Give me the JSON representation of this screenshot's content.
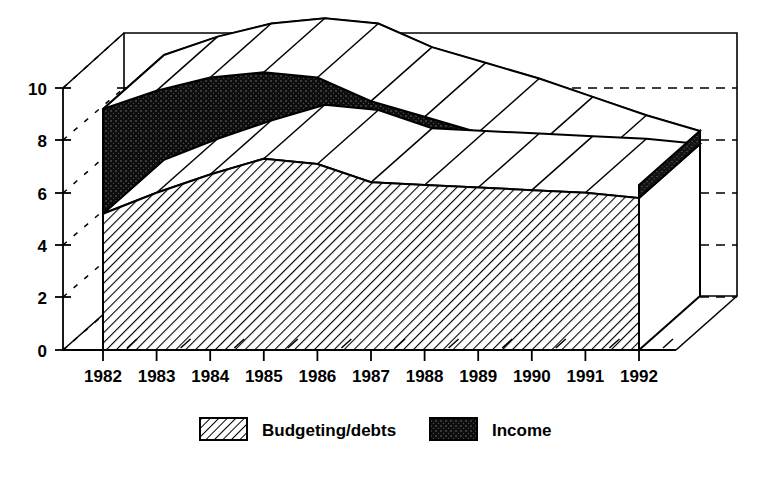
{
  "chart_data": {
    "type": "area",
    "style": "stacked-3d-area",
    "title": "",
    "subtitle": "",
    "xlabel": "",
    "ylabel": "",
    "categories": [
      "1982",
      "1983",
      "1984",
      "1985",
      "1986",
      "1987",
      "1988",
      "1989",
      "1990",
      "1991",
      "1992"
    ],
    "x": [
      1982,
      1983,
      1984,
      1985,
      1986,
      1987,
      1988,
      1989,
      1990,
      1991,
      1992
    ],
    "series": [
      {
        "name": "Budgeting/debts",
        "fill": "diagonal-hatch",
        "color": "#000000",
        "values": [
          5.2,
          6.0,
          6.7,
          7.3,
          7.1,
          6.4,
          6.3,
          6.2,
          6.1,
          6.0,
          5.8
        ]
      },
      {
        "name": "Income",
        "fill": "solid-black",
        "color": "#1a1a1a",
        "values": [
          4.0,
          3.9,
          3.7,
          3.3,
          3.3,
          3.1,
          2.6,
          2.1,
          1.5,
          0.9,
          0.5
        ]
      }
    ],
    "cumulative_top": [
      9.2,
      9.9,
      10.4,
      10.6,
      10.4,
      9.5,
      8.9,
      8.3,
      7.6,
      6.9,
      6.3
    ],
    "ylim": [
      0,
      11
    ],
    "yticks": [
      0,
      2,
      4,
      6,
      8,
      10
    ],
    "ytick_labels": [
      "0",
      "2",
      "4",
      "6",
      "8",
      "10"
    ],
    "grid": "dashed-horizontal-backwall",
    "legend_position": "bottom-center",
    "legend": [
      "Budgeting/debts",
      "Income"
    ]
  },
  "axes": {
    "y_labels": [
      "10",
      "8",
      "6",
      "4",
      "2",
      "0"
    ],
    "x_labels": [
      "1982",
      "1983",
      "1984",
      "1985",
      "1986",
      "1987",
      "1988",
      "1989",
      "1990",
      "1991",
      "1992"
    ]
  },
  "legend": {
    "items": [
      {
        "label": "Budgeting/debts",
        "swatch": "hatch-swatch"
      },
      {
        "label": "Income",
        "swatch": "solid-swatch"
      }
    ]
  },
  "colors": {
    "background": "#ffffff",
    "line": "#000000",
    "income_fill": "#1a1a1a",
    "budget_fill": "#ffffff"
  }
}
